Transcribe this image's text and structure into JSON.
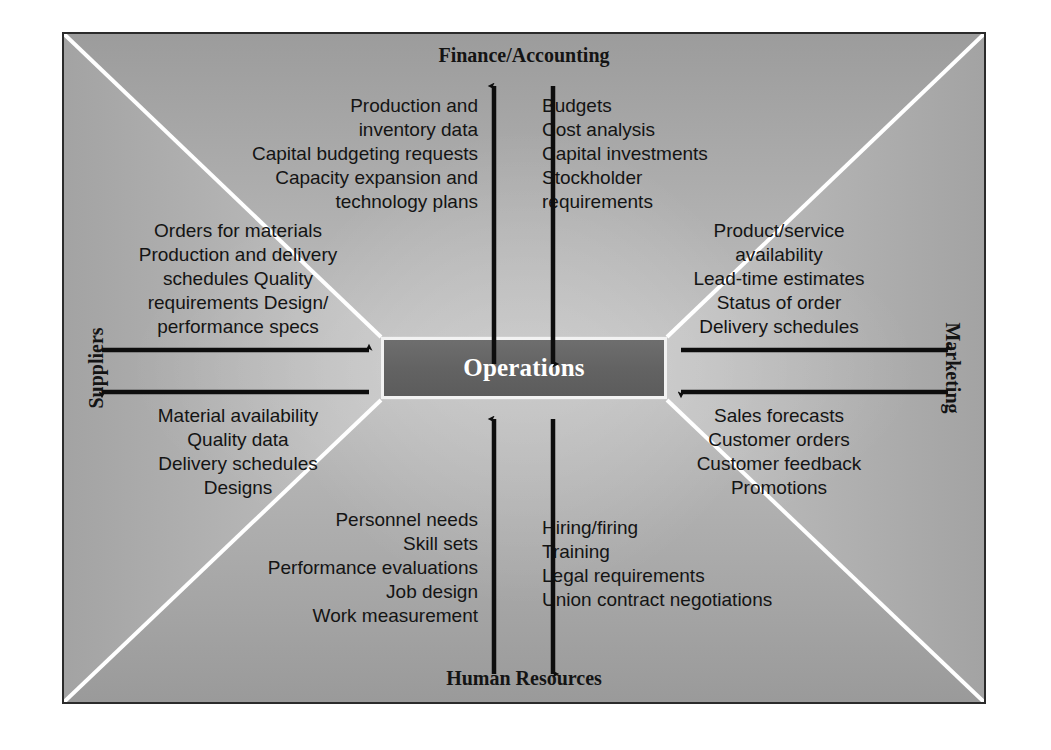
{
  "diagram": {
    "center": {
      "label": "Operations"
    },
    "headings": {
      "top": "Finance/Accounting",
      "bottom": "Human Resources",
      "left": "Suppliers",
      "right": "Marketing"
    },
    "flows": {
      "finance_to_operations_out": "Production and\ninventory data\nCapital budgeting requests\nCapacity expansion and\ntechnology plans",
      "finance_to_operations_in": "Budgets\nCost analysis\nCapital investments\nStockholder\n    requirements",
      "suppliers_out": "Orders for materials\nProduction and delivery\nschedules Quality\nrequirements Design/\nperformance specs",
      "suppliers_in": "Material availability\nQuality data\nDelivery schedules\nDesigns",
      "marketing_out": "Product/service\navailability\nLead-time estimates\nStatus of order\nDelivery schedules",
      "marketing_in": "Sales forecasts\nCustomer orders\nCustomer feedback\nPromotions",
      "hr_out": "Personnel needs\nSkill sets\nPerformance evaluations\nJob design\nWork measurement",
      "hr_in": "Hiring/firing\nTraining\nLegal requirements\nUnion contract negotiations"
    },
    "arrows": {
      "top_up": "arrow-up-operations-to-finance",
      "top_down": "arrow-down-finance-to-operations",
      "bottom_up": "arrow-up-operations-to-hr",
      "bottom_down": "arrow-down-hr-to-operations",
      "left_right": "arrow-right-suppliers-to-operations",
      "left_left": "arrow-left-operations-to-suppliers",
      "right_right": "arrow-right-operations-to-marketing",
      "right_left": "arrow-left-marketing-to-operations"
    },
    "colors": {
      "frame_border": "#2b2b2b",
      "center_box_fill": "#636363",
      "center_box_border": "#f2f2f2",
      "divider_line": "#ffffff",
      "text": "#141414",
      "center_text": "#ffffff"
    }
  }
}
